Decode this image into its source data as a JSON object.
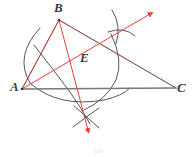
{
  "figure": {
    "caption": "(a)",
    "background_color": "#ffffff",
    "width": 196,
    "height": 157
  },
  "colors": {
    "construction_line": "#4a4a4a",
    "construction_arc": "#555555",
    "baseline": "#777777",
    "ray_red": "#e8403a",
    "label_text": "#3b3b3b"
  },
  "labels": [
    {
      "name": "A",
      "text": "A",
      "x": 10,
      "y": 80
    },
    {
      "name": "B",
      "text": "B",
      "x": 54,
      "y": 1
    },
    {
      "name": "C",
      "text": "C",
      "x": 177,
      "y": 81
    },
    {
      "name": "E",
      "text": "E",
      "x": 80,
      "y": 51
    }
  ],
  "points": {
    "A": {
      "x": 22,
      "y": 89
    },
    "B": {
      "x": 59,
      "y": 20
    },
    "C": {
      "x": 176,
      "y": 88
    },
    "E": {
      "x": 71,
      "y": 59
    },
    "arrow_tip_upper_right": {
      "x": 154,
      "y": 11
    },
    "arrow_tip_lower": {
      "x": 90,
      "y": 137
    },
    "arc_cross_upper_right": {
      "x": 122,
      "y": 27
    },
    "arc_cross_lower": {
      "x": 86,
      "y": 116
    }
  },
  "segments": [
    {
      "name": "side-ab",
      "from": "A",
      "to": "B",
      "color": "#4a4a4a",
      "width": 1
    },
    {
      "name": "side-bc",
      "from": "B",
      "to": "C",
      "color": "#4a4a4a",
      "width": 1
    },
    {
      "name": "side-ac-baseline",
      "from": "A",
      "to": "C",
      "color": "#777777",
      "width": 1.4
    },
    {
      "name": "segment-ae",
      "from": "A",
      "to": "E",
      "color": "#e8403a",
      "width": 1
    },
    {
      "name": "segment-be",
      "from": "B",
      "to": "E",
      "color": "#e8403a",
      "width": 1
    }
  ],
  "rays": [
    {
      "name": "angle-bisector-ray-from-A",
      "from": "A",
      "through_label": "E",
      "tip": "arrow_tip_upper_right",
      "color": "#e8403a",
      "has_arrowhead": true
    },
    {
      "name": "perpendicular-bisector-ray-from-B",
      "from": "B",
      "through_label": "E",
      "tip": "arrow_tip_lower",
      "color": "#e8403a",
      "has_arrowhead": true
    }
  ],
  "arcs": [
    {
      "name": "compass-arc-from-A-large",
      "center": "A",
      "radius": 98,
      "note": "sweeps from above AB down past AC"
    },
    {
      "name": "compass-arc-from-B",
      "center": "B",
      "radius": 100,
      "note": "sweeps down toward lower-right"
    },
    {
      "name": "compass-arc-from-C",
      "center": "C",
      "radius": 96,
      "note": "sweeps left and down"
    },
    {
      "name": "arc-mark-upper-right-1",
      "note": "short crossing tick at intersection"
    },
    {
      "name": "arc-mark-upper-right-2",
      "note": "short crossing tick at intersection"
    },
    {
      "name": "arc-mark-lower-1",
      "note": "short crossing tick at intersection"
    },
    {
      "name": "arc-mark-lower-2",
      "note": "short crossing tick at intersection"
    }
  ],
  "description": {
    "type": "euclidean-construction-diagram",
    "summary": "Triangle ABC with compass arcs constructing an angle bisector from A and a line from B, meeting at point E."
  }
}
